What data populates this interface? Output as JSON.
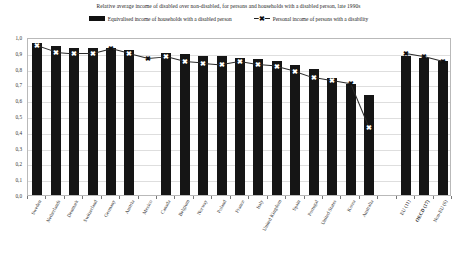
{
  "title": "Relative average income of disabled over non-disabled, for persons and households with a disabled person, late 1990s",
  "legend": {
    "bar_label": "Equivalised income of households with a disabled person",
    "line_label": "Personal income of persons with a disability",
    "marker_glyph": "✖",
    "bar_color": "#151515",
    "line_color": "#2a2a2a"
  },
  "chart_data": {
    "type": "bar",
    "title": "Relative average income of disabled over non-disabled, for persons and households with a disabled person, late 1990s",
    "xlabel": "",
    "ylabel": "",
    "ylim": [
      0.0,
      1.0
    ],
    "ytick_labels": [
      "1,0",
      "0,9",
      "0,8",
      "0,7",
      "0,6",
      "0,5",
      "0,4",
      "0,3",
      "0,2",
      "0,1",
      "0,0"
    ],
    "ytick_values": [
      1.0,
      0.9,
      0.8,
      0.7,
      0.6,
      0.5,
      0.4,
      0.3,
      0.2,
      0.1,
      0.0
    ],
    "grid": true,
    "legend_position": "top-center",
    "categories": [
      "Sweden",
      "Netherlands",
      "Denmark",
      "Switzerland",
      "Germany",
      "Austria",
      "Mexico",
      "Canada",
      "Belgium",
      "Norway",
      "Poland",
      "France",
      "Italy",
      "United Kingdom",
      "Spain",
      "Portugal",
      "United States",
      "Korea",
      "Australia",
      "",
      "EU (11)",
      "OECD (17)",
      "Non-EU (6)"
    ],
    "series": [
      {
        "name": "Equivalised income of households with a disabled person",
        "type": "bar",
        "values": [
          0.96,
          0.94,
          0.93,
          0.93,
          0.93,
          0.92,
          null,
          0.9,
          0.89,
          0.88,
          0.88,
          0.87,
          0.86,
          0.85,
          0.82,
          0.8,
          0.74,
          0.7,
          0.63,
          null,
          0.88,
          0.87,
          0.85
        ]
      },
      {
        "name": "Personal income of persons with a disability",
        "type": "line",
        "values": [
          0.96,
          0.92,
          0.91,
          0.91,
          0.94,
          0.91,
          0.88,
          0.89,
          0.86,
          0.85,
          0.84,
          0.86,
          0.84,
          0.83,
          0.8,
          0.76,
          0.74,
          0.72,
          0.44,
          null,
          0.91,
          0.89,
          0.86
        ]
      }
    ]
  },
  "bold_categories": [
    "OECD (17)"
  ]
}
